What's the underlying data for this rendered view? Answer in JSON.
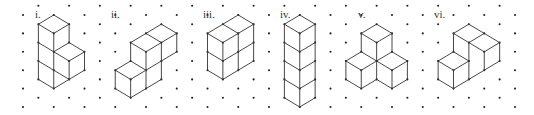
{
  "diagram": {
    "colors": {
      "background": "#ffffff",
      "dot": "#222222",
      "line": "#333333"
    },
    "grid": {
      "type": "isometric-dot",
      "origin_x": 23,
      "origin_y": 5.8,
      "half_col_dx": 15.375,
      "row_dy": 9.2,
      "cols": 33,
      "rows": 12,
      "dot_parity": "odd"
    },
    "figures": [
      {
        "label": "i.",
        "label_pos": [
          35,
          9
        ],
        "cube_count": 4,
        "segments": [
          [
            2,
            1,
            1,
            2
          ],
          [
            2,
            1,
            3,
            2
          ],
          [
            1,
            2,
            2,
            3
          ],
          [
            3,
            2,
            2,
            3
          ],
          [
            1,
            2,
            1,
            8
          ],
          [
            2,
            3,
            2,
            9
          ],
          [
            3,
            2,
            3,
            4
          ],
          [
            1,
            4,
            2,
            5
          ],
          [
            1,
            6,
            2,
            7
          ],
          [
            1,
            8,
            2,
            9
          ],
          [
            3,
            4,
            2,
            5
          ],
          [
            3,
            4,
            4,
            5
          ],
          [
            2,
            5,
            3,
            6
          ],
          [
            3,
            6,
            4,
            5
          ],
          [
            4,
            5,
            4,
            7
          ],
          [
            3,
            6,
            3,
            8
          ],
          [
            2,
            7,
            3,
            8
          ],
          [
            2,
            9,
            3,
            8
          ],
          [
            3,
            8,
            4,
            7
          ]
        ]
      },
      {
        "label": "ii.",
        "label_pos": [
          111,
          9
        ],
        "cube_count": 4,
        "segments": [
          [
            9,
            2,
            8,
            3
          ],
          [
            9,
            2,
            10,
            3
          ],
          [
            8,
            3,
            7,
            4
          ],
          [
            8,
            3,
            9,
            4
          ],
          [
            10,
            3,
            9,
            4
          ],
          [
            7,
            4,
            8,
            5
          ],
          [
            9,
            4,
            8,
            5
          ],
          [
            7,
            4,
            7,
            6
          ],
          [
            8,
            5,
            8,
            9
          ],
          [
            9,
            4,
            9,
            8
          ],
          [
            10,
            3,
            10,
            5
          ],
          [
            8,
            7,
            9,
            6
          ],
          [
            9,
            6,
            10,
            5
          ],
          [
            8,
            9,
            9,
            8
          ],
          [
            7,
            6,
            6,
            7
          ],
          [
            7,
            6,
            8,
            7
          ],
          [
            6,
            7,
            7,
            8
          ],
          [
            8,
            7,
            7,
            8
          ],
          [
            6,
            7,
            6,
            9
          ],
          [
            7,
            8,
            7,
            10
          ],
          [
            6,
            9,
            7,
            10
          ],
          [
            7,
            10,
            8,
            9
          ]
        ]
      },
      {
        "label": "iii.",
        "label_pos": [
          203,
          9
        ],
        "cube_count": 4,
        "segments": [
          [
            14,
            1,
            13,
            2
          ],
          [
            14,
            1,
            15,
            2
          ],
          [
            13,
            2,
            12,
            3
          ],
          [
            13,
            2,
            14,
            3
          ],
          [
            15,
            2,
            14,
            3
          ],
          [
            12,
            3,
            13,
            4
          ],
          [
            14,
            3,
            13,
            4
          ],
          [
            12,
            3,
            12,
            7
          ],
          [
            13,
            4,
            13,
            8
          ],
          [
            14,
            3,
            14,
            7
          ],
          [
            15,
            2,
            15,
            6
          ],
          [
            12,
            5,
            13,
            6
          ],
          [
            13,
            6,
            14,
            5
          ],
          [
            14,
            5,
            15,
            4
          ],
          [
            12,
            7,
            13,
            8
          ],
          [
            13,
            8,
            14,
            7
          ],
          [
            14,
            7,
            15,
            6
          ]
        ]
      },
      {
        "label": "iv.",
        "label_pos": [
          280,
          9
        ],
        "cube_count": 4,
        "segments": [
          [
            18,
            1,
            17,
            2
          ],
          [
            18,
            1,
            19,
            2
          ],
          [
            17,
            2,
            18,
            3
          ],
          [
            19,
            2,
            18,
            3
          ],
          [
            17,
            2,
            17,
            10
          ],
          [
            18,
            3,
            18,
            11
          ],
          [
            19,
            2,
            19,
            10
          ],
          [
            17,
            4,
            18,
            5
          ],
          [
            18,
            5,
            19,
            4
          ],
          [
            17,
            6,
            18,
            7
          ],
          [
            18,
            7,
            19,
            6
          ],
          [
            17,
            8,
            18,
            9
          ],
          [
            18,
            9,
            19,
            8
          ],
          [
            17,
            10,
            18,
            11
          ],
          [
            18,
            11,
            19,
            10
          ]
        ]
      },
      {
        "label": "v.",
        "label_pos": [
          358,
          9
        ],
        "cube_count": 3,
        "segments": [
          [
            23,
            2,
            22,
            3
          ],
          [
            23,
            2,
            24,
            3
          ],
          [
            22,
            3,
            23,
            4
          ],
          [
            24,
            3,
            23,
            4
          ],
          [
            22,
            3,
            22,
            5
          ],
          [
            23,
            4,
            23,
            6
          ],
          [
            24,
            3,
            24,
            5
          ],
          [
            22,
            5,
            21,
            6
          ],
          [
            22,
            5,
            23,
            6
          ],
          [
            21,
            6,
            22,
            7
          ],
          [
            22,
            7,
            23,
            6
          ],
          [
            24,
            5,
            23,
            6
          ],
          [
            24,
            5,
            25,
            6
          ],
          [
            23,
            6,
            24,
            7
          ],
          [
            24,
            7,
            25,
            6
          ],
          [
            21,
            6,
            21,
            8
          ],
          [
            22,
            7,
            22,
            9
          ],
          [
            23,
            6,
            23,
            8
          ],
          [
            24,
            7,
            24,
            9
          ],
          [
            25,
            6,
            25,
            8
          ],
          [
            21,
            8,
            22,
            9
          ],
          [
            22,
            9,
            23,
            8
          ],
          [
            23,
            8,
            24,
            9
          ],
          [
            24,
            9,
            25,
            8
          ]
        ]
      },
      {
        "label": "vi.",
        "label_pos": [
          434,
          9
        ],
        "cube_count": 3,
        "segments": [
          [
            29,
            2,
            28,
            3
          ],
          [
            29,
            2,
            30,
            3
          ],
          [
            30,
            3,
            31,
            4
          ],
          [
            28,
            3,
            29,
            4
          ],
          [
            29,
            4,
            30,
            3
          ],
          [
            29,
            4,
            30,
            5
          ],
          [
            30,
            5,
            31,
            4
          ],
          [
            28,
            3,
            28,
            5
          ],
          [
            29,
            4,
            29,
            8
          ],
          [
            30,
            5,
            30,
            7
          ],
          [
            31,
            4,
            31,
            6
          ],
          [
            30,
            7,
            31,
            6
          ],
          [
            29,
            8,
            30,
            7
          ],
          [
            28,
            5,
            27,
            6
          ],
          [
            28,
            5,
            29,
            6
          ],
          [
            27,
            6,
            28,
            7
          ],
          [
            28,
            7,
            29,
            6
          ],
          [
            27,
            6,
            27,
            8
          ],
          [
            28,
            7,
            28,
            9
          ],
          [
            27,
            8,
            28,
            9
          ],
          [
            28,
            9,
            29,
            8
          ]
        ]
      }
    ]
  }
}
